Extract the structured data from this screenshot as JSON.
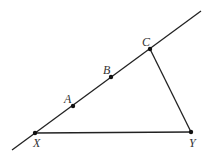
{
  "diagram": {
    "type": "geometry",
    "colors": {
      "stroke": "#222222",
      "label": "#333333",
      "background": "#ffffff"
    },
    "line": {
      "from": [
        12,
        150
      ],
      "to": [
        201,
        11
      ]
    },
    "points": [
      {
        "id": "X",
        "label": "X",
        "x": 35,
        "y": 133,
        "label_x": 33,
        "label_y": 147
      },
      {
        "id": "A",
        "label": "A",
        "x": 73,
        "y": 106,
        "label_x": 64,
        "label_y": 103
      },
      {
        "id": "B",
        "label": "B",
        "x": 111,
        "y": 77,
        "label_x": 103,
        "label_y": 74
      },
      {
        "id": "C",
        "label": "C",
        "x": 150,
        "y": 49,
        "label_x": 142,
        "label_y": 46
      },
      {
        "id": "Y",
        "label": "Y",
        "x": 191,
        "y": 132,
        "label_x": 189,
        "label_y": 147
      }
    ],
    "segments": [
      {
        "from": "X",
        "to": "Y"
      },
      {
        "from": "C",
        "to": "Y"
      }
    ]
  }
}
